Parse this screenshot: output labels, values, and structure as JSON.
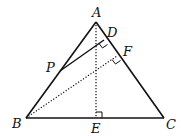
{
  "diagram": {
    "type": "geometry",
    "points": {
      "A": {
        "label": "A",
        "x": 96,
        "y": 22
      },
      "B": {
        "label": "B",
        "x": 26,
        "y": 118
      },
      "C": {
        "label": "C",
        "x": 164,
        "y": 118
      },
      "D": {
        "label": "D",
        "x": 104,
        "y": 40
      },
      "E": {
        "label": "E",
        "x": 96,
        "y": 118
      },
      "F": {
        "label": "F",
        "x": 117,
        "y": 56
      },
      "P": {
        "label": "P",
        "x": 60,
        "y": 71
      }
    },
    "solid_segments": [
      "AB",
      "BC",
      "CA",
      "PD"
    ],
    "dotted_segments": [
      "AE",
      "BF"
    ],
    "right_angles": [
      "D",
      "F",
      "E"
    ],
    "stroke_color": "#111111"
  }
}
